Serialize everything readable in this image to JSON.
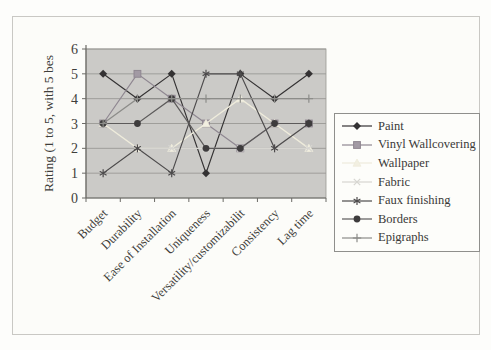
{
  "figure": {
    "type_label": "scanned-excel-line-chart"
  },
  "chart_data": {
    "type": "line",
    "title": "",
    "ylabel": "Rating (1 to 5, with 5 bes",
    "xlabel": "",
    "ylim": [
      0,
      6
    ],
    "yticks": [
      0,
      1,
      2,
      3,
      4,
      5,
      6
    ],
    "grid": true,
    "legend_position": "right",
    "plot_bg": "#cbcac7",
    "grid_color": "#9a9995",
    "axis_color": "#6b6a66",
    "label_color": "#3f3e3b",
    "categories": [
      "Budget",
      "Durability",
      "Ease of Installation",
      "Uniqueness",
      "Versatility/customizabilit",
      "Consistency",
      "Lag time"
    ],
    "series": [
      {
        "name": "Paint",
        "marker": "diamond",
        "color": "#343233",
        "fill": "#343233",
        "values": [
          5,
          4,
          5,
          1,
          5,
          4,
          5
        ]
      },
      {
        "name": "Vinyl Wallcovering",
        "marker": "square",
        "color": "#8f8791",
        "fill": "#a29aa4",
        "values": [
          3,
          5,
          4,
          3,
          2,
          3,
          3
        ]
      },
      {
        "name": "Wallpaper",
        "marker": "triangle",
        "color": "#efecdc",
        "fill": "#f2efe1",
        "values": [
          3,
          2,
          2,
          3,
          4,
          3,
          2
        ]
      },
      {
        "name": "Fabric",
        "marker": "x",
        "color": "#d7d6d1",
        "fill": "#d7d6d1",
        "values": [
          1,
          2,
          2,
          2,
          2,
          2,
          2
        ]
      },
      {
        "name": "Faux finishing",
        "marker": "asterisk",
        "color": "#4d4b4c",
        "fill": "#4d4b4c",
        "values": [
          1,
          2,
          1,
          5,
          5,
          2,
          3
        ]
      },
      {
        "name": "Borders",
        "marker": "circle",
        "color": "#5c5a5a",
        "fill": "#3e3c3d",
        "values": [
          3,
          3,
          4,
          2,
          2,
          3,
          3
        ]
      },
      {
        "name": "Epigraphs",
        "marker": "plus",
        "color": "#8c8c89",
        "fill": "#8c8c89",
        "values": [
          3,
          4,
          4,
          4,
          4,
          4,
          4
        ]
      }
    ]
  }
}
